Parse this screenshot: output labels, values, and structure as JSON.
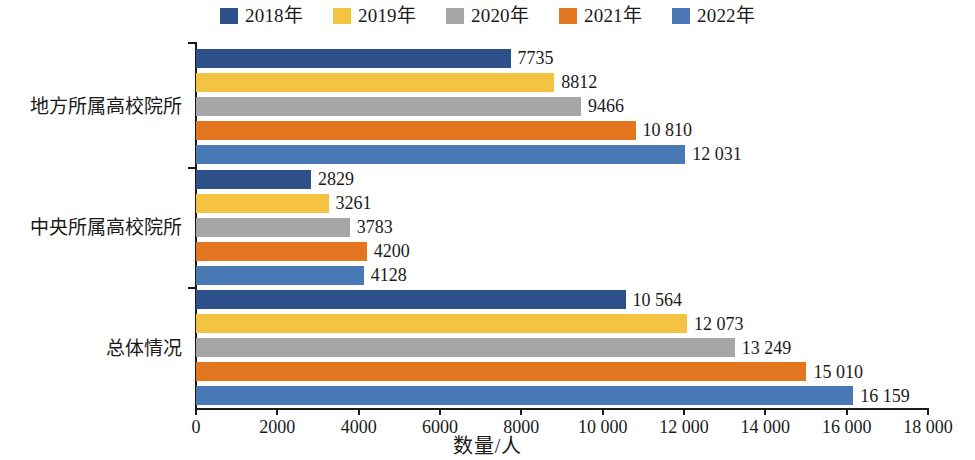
{
  "chart_data": {
    "type": "bar",
    "orientation": "horizontal",
    "title": "",
    "xlabel": "数量/人",
    "ylabel": "",
    "xlim": [
      0,
      18000
    ],
    "xticks": [
      0,
      2000,
      4000,
      6000,
      8000,
      10000,
      12000,
      14000,
      16000,
      18000
    ],
    "xtick_labels": [
      "0",
      "2000",
      "4000",
      "6000",
      "8000",
      "10 000",
      "12 000",
      "14 000",
      "16 000",
      "18 000"
    ],
    "grid": false,
    "legend_position": "top-center",
    "categories": [
      "地方所属高校院所",
      "中央所属高校院所",
      "总体情况"
    ],
    "series": [
      {
        "name": "2018年",
        "color": "#2d4f8a",
        "values": [
          7735,
          2829,
          10564
        ],
        "labels": [
          "7735",
          "2829",
          "10 564"
        ]
      },
      {
        "name": "2019年",
        "color": "#f5c342",
        "values": [
          8812,
          3261,
          12073
        ],
        "labels": [
          "8812",
          "3261",
          "12 073"
        ]
      },
      {
        "name": "2020年",
        "color": "#a6a6a6",
        "values": [
          9466,
          3783,
          13249
        ],
        "labels": [
          "9466",
          "3783",
          "13 249"
        ]
      },
      {
        "name": "2021年",
        "color": "#e4761f",
        "values": [
          10810,
          4200,
          15010
        ],
        "labels": [
          "10 810",
          "4200",
          "15 010"
        ]
      },
      {
        "name": "2022年",
        "color": "#4a7ab5",
        "values": [
          12031,
          4128,
          16159
        ],
        "labels": [
          "12 031",
          "4128",
          "16 159"
        ]
      }
    ]
  },
  "legend": {
    "items": [
      {
        "label": "2018年",
        "color": "#2d4f8a"
      },
      {
        "label": "2019年",
        "color": "#f5c342"
      },
      {
        "label": "2020年",
        "color": "#a6a6a6"
      },
      {
        "label": "2021年",
        "color": "#e4761f"
      },
      {
        "label": "2022年",
        "color": "#4a7ab5"
      }
    ]
  },
  "axis": {
    "x_title": "数量/人"
  }
}
